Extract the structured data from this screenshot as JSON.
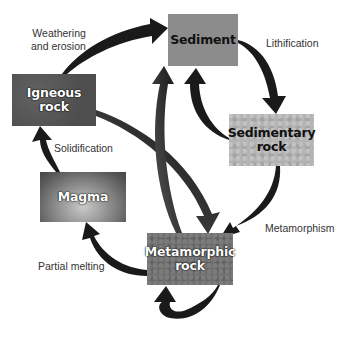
{
  "diagram": {
    "nodes": {
      "sediment": {
        "lines": [
          "Sediment"
        ]
      },
      "igneous": {
        "lines": [
          "Igneous",
          "rock"
        ]
      },
      "sedimentary": {
        "lines": [
          "Sedimentary",
          "rock"
        ]
      },
      "magma": {
        "lines": [
          "Magma"
        ]
      },
      "metamorphic": {
        "lines": [
          "Metamorphic",
          "rock"
        ]
      }
    },
    "labels": {
      "weathering": [
        "Weathering",
        "and erosion"
      ],
      "lithification": "Lithification",
      "solidification": "Solidification",
      "metamorphism": "Metamorphism",
      "partial_melting": "Partial melting"
    },
    "edges": [
      {
        "from": "Igneous rock",
        "to": "Sediment",
        "label": "Weathering and erosion"
      },
      {
        "from": "Sediment",
        "to": "Sedimentary rock",
        "label": "Lithification"
      },
      {
        "from": "Sedimentary rock",
        "to": "Sediment",
        "label": ""
      },
      {
        "from": "Sedimentary rock",
        "to": "Metamorphic rock",
        "label": "Metamorphism"
      },
      {
        "from": "Igneous rock",
        "to": "Metamorphic rock",
        "label": ""
      },
      {
        "from": "Metamorphic rock",
        "to": "Sediment",
        "label": ""
      },
      {
        "from": "Metamorphic rock",
        "to": "Magma",
        "label": "Partial melting"
      },
      {
        "from": "Magma",
        "to": "Igneous rock",
        "label": "Solidification"
      },
      {
        "from": "Metamorphic rock",
        "to": "Metamorphic rock",
        "label": ""
      }
    ],
    "colors": {
      "arrow": "#1a1a1a",
      "arrow_tail": "#555555",
      "sediment": "#8c8c8c",
      "igneous": "#565656",
      "sedimentary": "#b4b4b4",
      "magma": "#9a9a9a",
      "metamorphic": "#707070"
    }
  }
}
